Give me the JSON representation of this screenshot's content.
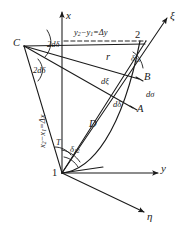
{
  "figure": {
    "type": "geodetic-geometry-diagram",
    "background_color": "#ffffff",
    "line_color": "#1a1a1a",
    "width": 188,
    "height": 233
  },
  "axes": {
    "x_label": "x",
    "y_label": "y",
    "xi_label": "ξ",
    "eta_label": "η"
  },
  "points": {
    "p1": "1",
    "p2": "2",
    "A": "A",
    "B": "B",
    "C": "C",
    "D": "D"
  },
  "labels": {
    "delta_y_eq": "y",
    "delta_y_sub1": "2",
    "delta_y_mid": "−y",
    "delta_y_sub2": "1",
    "delta_y_tail": "=Δy",
    "delta_x_eq": "x",
    "delta_x_sub1": "2",
    "delta_x_mid": "−x",
    "delta_x_sub2": "1",
    "delta_x_tail": "=Δx",
    "r": "r",
    "T": "T",
    "d_xi": "dξ",
    "d_sigma": "dσ",
    "d_delta": "dδ",
    "two_d_delta_upper": "2dδ",
    "two_d_delta_lower": "2dδ",
    "delta_21": "δ",
    "delta_21_sub": "21",
    "delta_12": "δ",
    "delta_12_sub": "12"
  }
}
